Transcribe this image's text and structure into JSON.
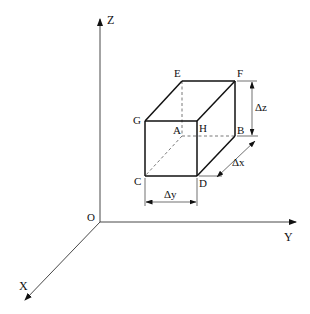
{
  "diagram": {
    "type": "3d-coordinate-box",
    "axes": {
      "origin_label": "O",
      "x_label": "X",
      "y_label": "Y",
      "z_label": "Z"
    },
    "vertices": {
      "A": "A",
      "B": "B",
      "C": "C",
      "D": "D",
      "E": "E",
      "F": "F",
      "G": "G",
      "H": "H"
    },
    "dimensions": {
      "dx": "Δx",
      "dy": "Δy",
      "dz": "Δz"
    },
    "colors": {
      "stroke": "#111111",
      "hidden": "#555555",
      "background": "#ffffff"
    }
  }
}
